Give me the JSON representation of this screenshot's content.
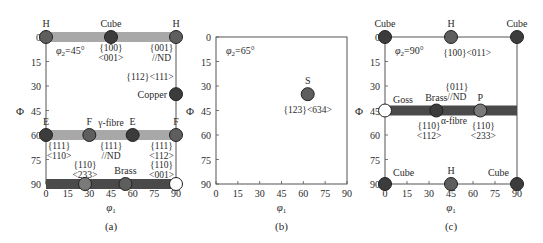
{
  "figure": {
    "axis_x_label": "φ1",
    "axis_y_label": "Φ",
    "x_ticks": [
      0,
      15,
      30,
      45,
      60,
      75,
      90
    ],
    "y_ticks": [
      0,
      15,
      30,
      45,
      60,
      75,
      90
    ],
    "colors": {
      "dot_dark": "#3c3c3c",
      "dot_mid": "#5e5e5e",
      "dot_light": "#7a7a7a",
      "dot_open": "#ffffff",
      "fibre_light": "#a8a8a8",
      "fibre_dark": "#4a4a4a",
      "axis": "#555555"
    }
  },
  "panels": [
    {
      "id": "a",
      "caption": "(a)",
      "phi2_label": "φ2=45°",
      "fibres": [
        {
          "name": "rd-fibre-top",
          "phi_from": 0,
          "phi_to": 90,
          "Phi": 0,
          "tone": "light"
        },
        {
          "name": "gamma-fibre",
          "phi_from": 0,
          "phi_to": 90,
          "Phi": 60,
          "tone": "light"
        },
        {
          "name": "alpha-fibre-bottom",
          "phi_from": 0,
          "phi_to": 90,
          "Phi": 90,
          "tone": "dark"
        }
      ],
      "points": [
        {
          "label": "H",
          "phi1": 0,
          "Phi": 0,
          "tone": "mid",
          "label_pos": "above"
        },
        {
          "label": "Cube",
          "phi1": 45,
          "Phi": 0,
          "tone": "dark",
          "label_pos": "above"
        },
        {
          "label": "H",
          "phi1": 90,
          "Phi": 0,
          "tone": "mid",
          "label_pos": "above"
        },
        {
          "label": "Copper",
          "phi1": 90,
          "Phi": 35,
          "tone": "dark",
          "label_pos": "left"
        },
        {
          "label": "E",
          "phi1": 0,
          "Phi": 60,
          "tone": "dark",
          "label_pos": "above"
        },
        {
          "label": "F",
          "phi1": 30,
          "Phi": 60,
          "tone": "mid",
          "label_pos": "above"
        },
        {
          "label": "E",
          "phi1": 60,
          "Phi": 60,
          "tone": "dark",
          "label_pos": "above"
        },
        {
          "label": "F",
          "phi1": 90,
          "Phi": 60,
          "tone": "mid",
          "label_pos": "above"
        },
        {
          "label": "",
          "phi1": 27,
          "Phi": 90,
          "tone": "light",
          "label_pos": "none"
        },
        {
          "label": "Brass",
          "phi1": 55,
          "Phi": 90,
          "tone": "mid",
          "label_pos": "above"
        },
        {
          "label": "",
          "phi1": 90,
          "Phi": 90,
          "tone": "open",
          "label_pos": "none"
        }
      ],
      "annotations": [
        {
          "lines": [
            "{100}",
            "<001>"
          ],
          "phi1": 45,
          "Phi": 6
        },
        {
          "lines": [
            "{001}",
            "//ND"
          ],
          "phi1": 80,
          "Phi": 6
        },
        {
          "lines": [
            "{112}<111>"
          ],
          "phi1": 72,
          "Phi": 24
        },
        {
          "lines": [
            "γ-fibre"
          ],
          "phi1": 45,
          "Phi": 52
        },
        {
          "lines": [
            "{111}",
            "<110>"
          ],
          "phi1": 9,
          "Phi": 66
        },
        {
          "lines": [
            "{111}",
            "//ND"
          ],
          "phi1": 45,
          "Phi": 66
        },
        {
          "lines": [
            "{111}",
            "<112>"
          ],
          "phi1": 80,
          "Phi": 66
        },
        {
          "lines": [
            "{110}",
            "<233>"
          ],
          "phi1": 27,
          "Phi": 78
        },
        {
          "lines": [
            "{110}",
            "<001>"
          ],
          "phi1": 80,
          "Phi": 78
        }
      ]
    },
    {
      "id": "b",
      "caption": "(b)",
      "phi2_label": "φ2=65°",
      "fibres": [],
      "points": [
        {
          "label": "S",
          "phi1": 63,
          "Phi": 35,
          "tone": "mid",
          "label_pos": "above"
        }
      ],
      "annotations": [
        {
          "lines": [
            "{123}<634>"
          ],
          "phi1": 63,
          "Phi": 44
        }
      ]
    },
    {
      "id": "c",
      "caption": "(c)",
      "phi2_label": "φ2=90°",
      "fibres": [
        {
          "name": "alpha-fibre",
          "phi_from": 0,
          "phi_to": 90,
          "Phi": 45,
          "tone": "dark"
        }
      ],
      "points": [
        {
          "label": "Cube",
          "phi1": 0,
          "Phi": 0,
          "tone": "dark",
          "label_pos": "above"
        },
        {
          "label": "H",
          "phi1": 45,
          "Phi": 0,
          "tone": "mid",
          "label_pos": "above"
        },
        {
          "label": "Cube",
          "phi1": 90,
          "Phi": 0,
          "tone": "dark",
          "label_pos": "above"
        },
        {
          "label": "Goss",
          "phi1": 0,
          "Phi": 45,
          "tone": "open",
          "label_pos": "above-right"
        },
        {
          "label": "Brass",
          "phi1": 35,
          "Phi": 45,
          "tone": "dark",
          "label_pos": "above"
        },
        {
          "label": "P",
          "phi1": 65,
          "Phi": 45,
          "tone": "light",
          "label_pos": "above"
        },
        {
          "label": "Cube",
          "phi1": 0,
          "Phi": 90,
          "tone": "dark",
          "label_pos": "above-right"
        },
        {
          "label": "H",
          "phi1": 45,
          "Phi": 90,
          "tone": "mid",
          "label_pos": "above"
        },
        {
          "label": "Cube",
          "phi1": 90,
          "Phi": 90,
          "tone": "dark",
          "label_pos": "above-left"
        }
      ],
      "annotations": [
        {
          "lines": [
            "{100}<011>"
          ],
          "phi1": 56,
          "Phi": 9
        },
        {
          "lines": [
            "{011}",
            "//ND"
          ],
          "phi1": 49,
          "Phi": 30
        },
        {
          "lines": [
            "{110}",
            "<112>"
          ],
          "phi1": 30,
          "Phi": 54
        },
        {
          "lines": [
            "α-fibre"
          ],
          "phi1": 47,
          "Phi": 51
        },
        {
          "lines": [
            "{110}",
            "<233>"
          ],
          "phi1": 67,
          "Phi": 54
        }
      ]
    }
  ]
}
